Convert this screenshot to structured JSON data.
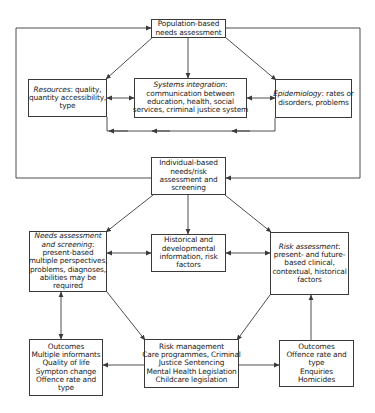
{
  "diagram": {
    "population": {
      "lines": [
        "Population-based",
        "needs assessment"
      ]
    },
    "resources": {
      "label_italic": "Resources",
      "lines": [
        ": quality,",
        "quantity accessibility,",
        "type"
      ]
    },
    "systems": {
      "label_italic": "Systems integration",
      "lines": [
        ":",
        "communication between",
        "education, health, social",
        "services, criminal justice system"
      ]
    },
    "epidemiology": {
      "label_italic": "Epidemiology",
      "lines": [
        ": rates or",
        "disorders, problems"
      ]
    },
    "individual": {
      "lines": [
        "Individual-based",
        "needs/risk",
        "assessment and",
        "screening"
      ]
    },
    "needs": {
      "label_italic_1": "Needs assessment",
      "label_italic_2": "and screening",
      "lines": [
        ":",
        "present-based",
        "multiple perspectives,",
        "problems, diagnoses,",
        "abilities may be",
        "required"
      ]
    },
    "historical": {
      "lines": [
        "Historical and",
        "developmental",
        "information, risk",
        "factors"
      ]
    },
    "risk_assessment": {
      "label_italic": "Risk assessment",
      "lines": [
        ":",
        "present- and future-",
        "based clinical,",
        "contextual, historical",
        "factors"
      ]
    },
    "outcomes_left": {
      "lines": [
        "Outcomes",
        "Multiple informants",
        "Quality of life",
        "Sympton change",
        "Offence rate and",
        "type"
      ]
    },
    "risk_management": {
      "lines": [
        "Risk management",
        "Care programmes, Criminal",
        "Justice Sentencing",
        "Mental Health Legislation",
        "Childcare legislation"
      ]
    },
    "outcomes_right": {
      "lines": [
        "Outcomes",
        "Offence rate and",
        "type",
        "Enquiries",
        "Homicides"
      ]
    }
  },
  "colors": {
    "line": "#3a3a3a",
    "text": "#222222",
    "background": "#ffffff"
  }
}
